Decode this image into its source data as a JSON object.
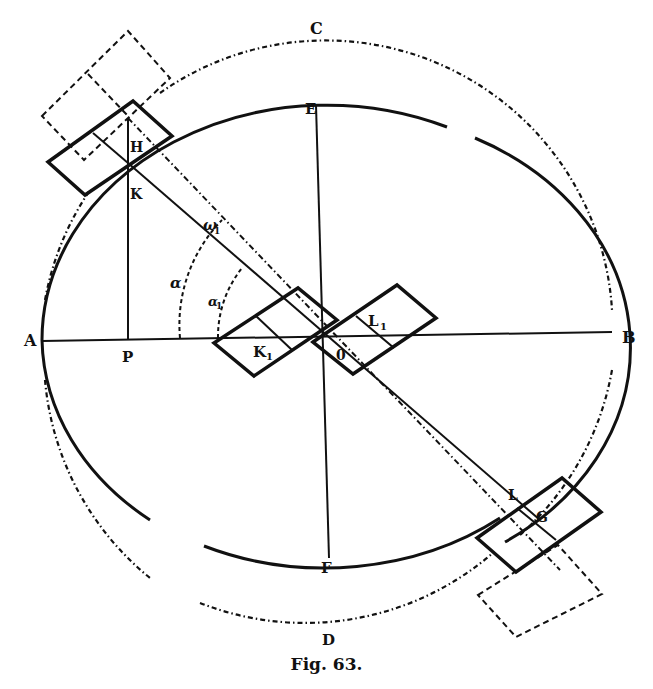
{
  "figure": {
    "caption": "Fig. 63.",
    "colors": {
      "ink": "#111111",
      "background": "#ffffff"
    },
    "points": {
      "A": "A",
      "B": "B",
      "C": "C",
      "D": "D",
      "E": "E",
      "F": "F",
      "H": "H",
      "K": "K",
      "P": "P",
      "O": "0",
      "L": "L",
      "G": "G",
      "K1": "K",
      "K1_sub": "1",
      "L1": "L",
      "L1_sub": "1"
    },
    "angles": {
      "alpha": "α",
      "alpha1": "α",
      "alpha1_sub": "1",
      "omega": "ω",
      "omega_sub": "1"
    },
    "shapes": {
      "ellipse": "solid ellipse with axes AB and EF",
      "circle": "dash-dotted circle through C and D",
      "rectangles": [
        "upper-left at H",
        "K1 near center",
        "L1 near center",
        "lower-right at G"
      ],
      "dashed_rectangles": [
        "upper-left outside",
        "lower-right outside"
      ]
    }
  }
}
